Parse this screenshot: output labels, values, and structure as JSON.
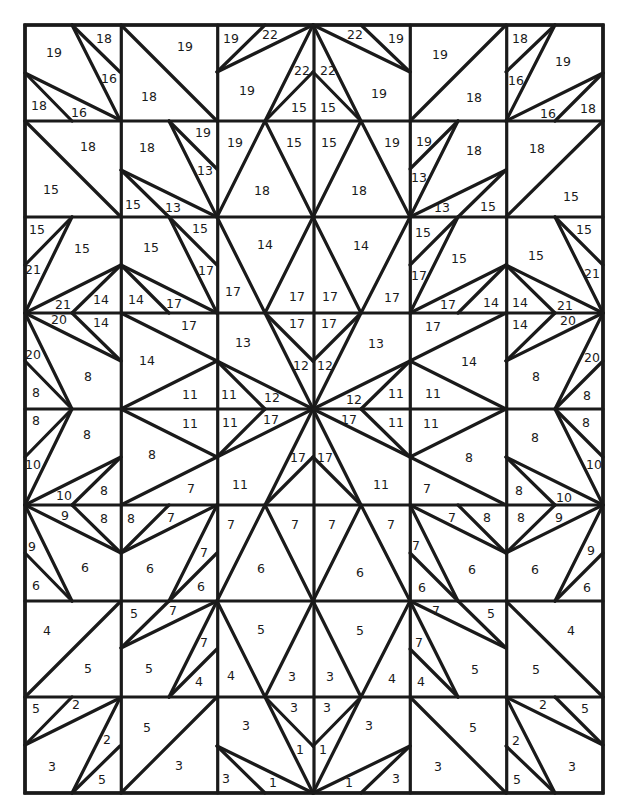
{
  "grid": {
    "cols": 6,
    "rows": 8,
    "x": [
      25,
      121.3,
      217.7,
      314,
      410.3,
      506.7,
      603
    ],
    "y": [
      25,
      121,
      217,
      313,
      409,
      505,
      601,
      697,
      793
    ],
    "line_color": "#1a1a1a",
    "background": "#ffffff"
  },
  "top_half_lines": [
    [
      72,
      25,
      120,
      120
    ],
    [
      72,
      25,
      120,
      72
    ],
    [
      25,
      73,
      120,
      120
    ],
    [
      25,
      73,
      72,
      121
    ],
    [
      121,
      25,
      217,
      121
    ],
    [
      217,
      72,
      265,
      25
    ],
    [
      217,
      72,
      313,
      25
    ],
    [
      313,
      25,
      265,
      121
    ],
    [
      265,
      121,
      313,
      72
    ],
    [
      410,
      72,
      361,
      25
    ],
    [
      410,
      72,
      313,
      25
    ],
    [
      313,
      25,
      361,
      121
    ],
    [
      361,
      121,
      313,
      72
    ],
    [
      410,
      121,
      506,
      25
    ],
    [
      555,
      25,
      506,
      121
    ],
    [
      555,
      25,
      506,
      72
    ],
    [
      603,
      73,
      506,
      121
    ],
    [
      603,
      73,
      555,
      121
    ],
    [
      25,
      121,
      121,
      217
    ],
    [
      169,
      121,
      217,
      217
    ],
    [
      169,
      121,
      217,
      169
    ],
    [
      121,
      170,
      217,
      217
    ],
    [
      121,
      170,
      169,
      217
    ],
    [
      217,
      217,
      265,
      121
    ],
    [
      265,
      121,
      313,
      217
    ],
    [
      313,
      217,
      361,
      121
    ],
    [
      361,
      121,
      410,
      217
    ],
    [
      410,
      217,
      458,
      121
    ],
    [
      458,
      121,
      410,
      169
    ],
    [
      410,
      217,
      506,
      170
    ],
    [
      506,
      170,
      458,
      217
    ],
    [
      506,
      217,
      603,
      121
    ],
    [
      25,
      313,
      72,
      217
    ],
    [
      72,
      217,
      25,
      265
    ],
    [
      25,
      313,
      121,
      265
    ],
    [
      121,
      265,
      72,
      313
    ],
    [
      121,
      265,
      217,
      313
    ],
    [
      121,
      265,
      169,
      313
    ],
    [
      169,
      217,
      217,
      313
    ],
    [
      169,
      217,
      217,
      265
    ],
    [
      217,
      217,
      265,
      313
    ],
    [
      265,
      313,
      313,
      217
    ],
    [
      313,
      217,
      361,
      313
    ],
    [
      361,
      313,
      410,
      217
    ],
    [
      410,
      313,
      458,
      217
    ],
    [
      458,
      217,
      410,
      265
    ],
    [
      410,
      313,
      506,
      265
    ],
    [
      506,
      265,
      458,
      313
    ],
    [
      506,
      265,
      603,
      313
    ],
    [
      506,
      265,
      555,
      313
    ],
    [
      555,
      217,
      603,
      313
    ],
    [
      555,
      217,
      603,
      265
    ],
    [
      25,
      313,
      121,
      361
    ],
    [
      25,
      313,
      72,
      409
    ],
    [
      72,
      313,
      121,
      361
    ],
    [
      25,
      361,
      72,
      409
    ],
    [
      121,
      313,
      217,
      361
    ],
    [
      121,
      409,
      217,
      361
    ],
    [
      217,
      361,
      313,
      409
    ],
    [
      217,
      361,
      265,
      409
    ],
    [
      265,
      313,
      313,
      409
    ],
    [
      265,
      313,
      313,
      361
    ],
    [
      361,
      313,
      313,
      361
    ],
    [
      361,
      313,
      313,
      409
    ],
    [
      410,
      361,
      313,
      409
    ],
    [
      410,
      361,
      361,
      409
    ],
    [
      410,
      361,
      506,
      313
    ],
    [
      410,
      361,
      506,
      409
    ],
    [
      603,
      313,
      506,
      361
    ],
    [
      603,
      313,
      555,
      409
    ],
    [
      555,
      313,
      506,
      361
    ],
    [
      603,
      361,
      555,
      409
    ]
  ],
  "mirror_axis_y": 409,
  "labels": [
    {
      "t": "19",
      "x": 54,
      "y": 53
    },
    {
      "t": "18",
      "x": 104,
      "y": 39
    },
    {
      "t": "16",
      "x": 109,
      "y": 79
    },
    {
      "t": "18",
      "x": 39,
      "y": 106
    },
    {
      "t": "16",
      "x": 79,
      "y": 113
    },
    {
      "t": "19",
      "x": 185,
      "y": 47
    },
    {
      "t": "18",
      "x": 149,
      "y": 97
    },
    {
      "t": "19",
      "x": 231,
      "y": 39
    },
    {
      "t": "22",
      "x": 270,
      "y": 35
    },
    {
      "t": "19",
      "x": 247,
      "y": 91
    },
    {
      "t": "22",
      "x": 302,
      "y": 71
    },
    {
      "t": "15",
      "x": 299,
      "y": 108
    },
    {
      "t": "22",
      "x": 355,
      "y": 35
    },
    {
      "t": "19",
      "x": 396,
      "y": 39
    },
    {
      "t": "22",
      "x": 328,
      "y": 71
    },
    {
      "t": "15",
      "x": 328,
      "y": 108
    },
    {
      "t": "19",
      "x": 379,
      "y": 94
    },
    {
      "t": "19",
      "x": 440,
      "y": 55
    },
    {
      "t": "18",
      "x": 474,
      "y": 98
    },
    {
      "t": "18",
      "x": 520,
      "y": 39
    },
    {
      "t": "19",
      "x": 563,
      "y": 62
    },
    {
      "t": "16",
      "x": 516,
      "y": 81
    },
    {
      "t": "16",
      "x": 548,
      "y": 114
    },
    {
      "t": "18",
      "x": 588,
      "y": 109
    },
    {
      "t": "18",
      "x": 88,
      "y": 147
    },
    {
      "t": "15",
      "x": 51,
      "y": 190
    },
    {
      "t": "18",
      "x": 147,
      "y": 148
    },
    {
      "t": "19",
      "x": 203,
      "y": 133
    },
    {
      "t": "13",
      "x": 205,
      "y": 171
    },
    {
      "t": "15",
      "x": 133,
      "y": 205
    },
    {
      "t": "13",
      "x": 173,
      "y": 208
    },
    {
      "t": "19",
      "x": 235,
      "y": 143
    },
    {
      "t": "15",
      "x": 294,
      "y": 143
    },
    {
      "t": "18",
      "x": 262,
      "y": 191
    },
    {
      "t": "15",
      "x": 329,
      "y": 143
    },
    {
      "t": "19",
      "x": 392,
      "y": 143
    },
    {
      "t": "18",
      "x": 359,
      "y": 191
    },
    {
      "t": "19",
      "x": 424,
      "y": 142
    },
    {
      "t": "18",
      "x": 474,
      "y": 151
    },
    {
      "t": "13",
      "x": 419,
      "y": 178
    },
    {
      "t": "13",
      "x": 442,
      "y": 208
    },
    {
      "t": "15",
      "x": 488,
      "y": 207
    },
    {
      "t": "18",
      "x": 537,
      "y": 149
    },
    {
      "t": "15",
      "x": 571,
      "y": 197
    },
    {
      "t": "15",
      "x": 37,
      "y": 230
    },
    {
      "t": "15",
      "x": 82,
      "y": 249
    },
    {
      "t": "21",
      "x": 33,
      "y": 270
    },
    {
      "t": "21",
      "x": 63,
      "y": 305
    },
    {
      "t": "14",
      "x": 101,
      "y": 300
    },
    {
      "t": "15",
      "x": 151,
      "y": 248
    },
    {
      "t": "15",
      "x": 200,
      "y": 229
    },
    {
      "t": "17",
      "x": 206,
      "y": 271
    },
    {
      "t": "14",
      "x": 136,
      "y": 300
    },
    {
      "t": "17",
      "x": 174,
      "y": 304
    },
    {
      "t": "14",
      "x": 265,
      "y": 245
    },
    {
      "t": "17",
      "x": 233,
      "y": 292
    },
    {
      "t": "17",
      "x": 297,
      "y": 297
    },
    {
      "t": "17",
      "x": 330,
      "y": 297
    },
    {
      "t": "14",
      "x": 361,
      "y": 246
    },
    {
      "t": "17",
      "x": 392,
      "y": 298
    },
    {
      "t": "15",
      "x": 423,
      "y": 233
    },
    {
      "t": "15",
      "x": 459,
      "y": 259
    },
    {
      "t": "17",
      "x": 419,
      "y": 276
    },
    {
      "t": "17",
      "x": 448,
      "y": 305
    },
    {
      "t": "14",
      "x": 491,
      "y": 303
    },
    {
      "t": "15",
      "x": 536,
      "y": 256
    },
    {
      "t": "15",
      "x": 584,
      "y": 230
    },
    {
      "t": "21",
      "x": 592,
      "y": 274
    },
    {
      "t": "14",
      "x": 520,
      "y": 303
    },
    {
      "t": "21",
      "x": 565,
      "y": 306
    },
    {
      "t": "20",
      "x": 59,
      "y": 320
    },
    {
      "t": "14",
      "x": 101,
      "y": 323
    },
    {
      "t": "20",
      "x": 33,
      "y": 355
    },
    {
      "t": "8",
      "x": 88,
      "y": 377
    },
    {
      "t": "8",
      "x": 36,
      "y": 393
    },
    {
      "t": "17",
      "x": 189,
      "y": 326
    },
    {
      "t": "14",
      "x": 147,
      "y": 361
    },
    {
      "t": "11",
      "x": 190,
      "y": 395
    },
    {
      "t": "13",
      "x": 243,
      "y": 343
    },
    {
      "t": "11",
      "x": 229,
      "y": 395
    },
    {
      "t": "12",
      "x": 272,
      "y": 398
    },
    {
      "t": "17",
      "x": 297,
      "y": 324
    },
    {
      "t": "12",
      "x": 301,
      "y": 366
    },
    {
      "t": "17",
      "x": 329,
      "y": 324
    },
    {
      "t": "12",
      "x": 325,
      "y": 366
    },
    {
      "t": "13",
      "x": 376,
      "y": 344
    },
    {
      "t": "12",
      "x": 354,
      "y": 400
    },
    {
      "t": "11",
      "x": 396,
      "y": 394
    },
    {
      "t": "17",
      "x": 433,
      "y": 327
    },
    {
      "t": "14",
      "x": 469,
      "y": 362
    },
    {
      "t": "11",
      "x": 433,
      "y": 394
    },
    {
      "t": "14",
      "x": 520,
      "y": 325
    },
    {
      "t": "20",
      "x": 568,
      "y": 321
    },
    {
      "t": "20",
      "x": 592,
      "y": 358
    },
    {
      "t": "8",
      "x": 536,
      "y": 377
    },
    {
      "t": "8",
      "x": 587,
      "y": 396
    },
    {
      "t": "8",
      "x": 36,
      "y": 421
    },
    {
      "t": "8",
      "x": 87,
      "y": 435
    },
    {
      "t": "10",
      "x": 33,
      "y": 465
    },
    {
      "t": "10",
      "x": 64,
      "y": 496
    },
    {
      "t": "8",
      "x": 104,
      "y": 491
    },
    {
      "t": "11",
      "x": 190,
      "y": 424
    },
    {
      "t": "8",
      "x": 152,
      "y": 455
    },
    {
      "t": "7",
      "x": 191,
      "y": 489
    },
    {
      "t": "11",
      "x": 230,
      "y": 423
    },
    {
      "t": "17",
      "x": 271,
      "y": 420
    },
    {
      "t": "11",
      "x": 240,
      "y": 485
    },
    {
      "t": "17",
      "x": 298,
      "y": 458
    },
    {
      "t": "17",
      "x": 349,
      "y": 420
    },
    {
      "t": "17",
      "x": 325,
      "y": 458
    },
    {
      "t": "11",
      "x": 396,
      "y": 423
    },
    {
      "t": "11",
      "x": 381,
      "y": 485
    },
    {
      "t": "11",
      "x": 431,
      "y": 424
    },
    {
      "t": "8",
      "x": 469,
      "y": 458
    },
    {
      "t": "7",
      "x": 427,
      "y": 489
    },
    {
      "t": "8",
      "x": 535,
      "y": 438
    },
    {
      "t": "8",
      "x": 586,
      "y": 423
    },
    {
      "t": "10",
      "x": 594,
      "y": 465
    },
    {
      "t": "8",
      "x": 519,
      "y": 491
    },
    {
      "t": "10",
      "x": 564,
      "y": 498
    },
    {
      "t": "9",
      "x": 65,
      "y": 516
    },
    {
      "t": "8",
      "x": 104,
      "y": 519
    },
    {
      "t": "9",
      "x": 32,
      "y": 547
    },
    {
      "t": "6",
      "x": 85,
      "y": 568
    },
    {
      "t": "6",
      "x": 36,
      "y": 586
    },
    {
      "t": "8",
      "x": 131,
      "y": 519
    },
    {
      "t": "7",
      "x": 171,
      "y": 518
    },
    {
      "t": "7",
      "x": 204,
      "y": 553
    },
    {
      "t": "6",
      "x": 150,
      "y": 569
    },
    {
      "t": "6",
      "x": 201,
      "y": 587
    },
    {
      "t": "7",
      "x": 231,
      "y": 525
    },
    {
      "t": "7",
      "x": 295,
      "y": 525
    },
    {
      "t": "6",
      "x": 261,
      "y": 569
    },
    {
      "t": "7",
      "x": 332,
      "y": 525
    },
    {
      "t": "7",
      "x": 391,
      "y": 525
    },
    {
      "t": "6",
      "x": 360,
      "y": 573
    },
    {
      "t": "7",
      "x": 452,
      "y": 518
    },
    {
      "t": "8",
      "x": 487,
      "y": 518
    },
    {
      "t": "7",
      "x": 416,
      "y": 546
    },
    {
      "t": "6",
      "x": 472,
      "y": 570
    },
    {
      "t": "6",
      "x": 422,
      "y": 588
    },
    {
      "t": "8",
      "x": 521,
      "y": 518
    },
    {
      "t": "9",
      "x": 559,
      "y": 518
    },
    {
      "t": "9",
      "x": 591,
      "y": 551
    },
    {
      "t": "6",
      "x": 535,
      "y": 570
    },
    {
      "t": "6",
      "x": 587,
      "y": 588
    },
    {
      "t": "4",
      "x": 47,
      "y": 631
    },
    {
      "t": "5",
      "x": 88,
      "y": 669
    },
    {
      "t": "5",
      "x": 134,
      "y": 614
    },
    {
      "t": "7",
      "x": 173,
      "y": 611
    },
    {
      "t": "7",
      "x": 204,
      "y": 643
    },
    {
      "t": "5",
      "x": 149,
      "y": 669
    },
    {
      "t": "4",
      "x": 199,
      "y": 682
    },
    {
      "t": "5",
      "x": 261,
      "y": 630
    },
    {
      "t": "4",
      "x": 231,
      "y": 676
    },
    {
      "t": "3",
      "x": 292,
      "y": 677
    },
    {
      "t": "3",
      "x": 330,
      "y": 677
    },
    {
      "t": "5",
      "x": 360,
      "y": 631
    },
    {
      "t": "4",
      "x": 392,
      "y": 679
    },
    {
      "t": "7",
      "x": 436,
      "y": 611
    },
    {
      "t": "5",
      "x": 491,
      "y": 614
    },
    {
      "t": "7",
      "x": 419,
      "y": 643
    },
    {
      "t": "5",
      "x": 475,
      "y": 670
    },
    {
      "t": "4",
      "x": 421,
      "y": 682
    },
    {
      "t": "4",
      "x": 571,
      "y": 631
    },
    {
      "t": "5",
      "x": 536,
      "y": 670
    },
    {
      "t": "5",
      "x": 36,
      "y": 709
    },
    {
      "t": "2",
      "x": 76,
      "y": 705
    },
    {
      "t": "2",
      "x": 107,
      "y": 740
    },
    {
      "t": "3",
      "x": 52,
      "y": 767
    },
    {
      "t": "5",
      "x": 102,
      "y": 780
    },
    {
      "t": "5",
      "x": 147,
      "y": 728
    },
    {
      "t": "3",
      "x": 179,
      "y": 766
    },
    {
      "t": "3",
      "x": 246,
      "y": 726
    },
    {
      "t": "3",
      "x": 294,
      "y": 708
    },
    {
      "t": "1",
      "x": 300,
      "y": 750
    },
    {
      "t": "3",
      "x": 226,
      "y": 779
    },
    {
      "t": "1",
      "x": 273,
      "y": 783
    },
    {
      "t": "3",
      "x": 327,
      "y": 708
    },
    {
      "t": "1",
      "x": 323,
      "y": 750
    },
    {
      "t": "3",
      "x": 369,
      "y": 726
    },
    {
      "t": "1",
      "x": 349,
      "y": 783
    },
    {
      "t": "3",
      "x": 396,
      "y": 779
    },
    {
      "t": "5",
      "x": 473,
      "y": 728
    },
    {
      "t": "3",
      "x": 438,
      "y": 767
    },
    {
      "t": "2",
      "x": 543,
      "y": 705
    },
    {
      "t": "5",
      "x": 585,
      "y": 709
    },
    {
      "t": "2",
      "x": 516,
      "y": 741
    },
    {
      "t": "3",
      "x": 572,
      "y": 767
    },
    {
      "t": "5",
      "x": 517,
      "y": 780
    }
  ]
}
